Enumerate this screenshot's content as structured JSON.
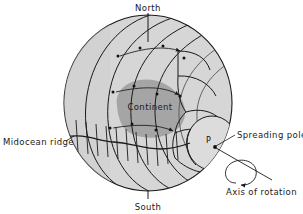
{
  "figure": {
    "title": "",
    "type": "geological-diagram"
  },
  "labels": {
    "north": "North",
    "south": "South",
    "continent": "Continent",
    "midocean_ridge": "Midocean ridge",
    "spreading_pole": "Spreading pole",
    "axis_of_rotation": "Axis of rotation",
    "pole_marker": "P"
  },
  "colors": {
    "background": "#ffffff",
    "sphere_fill": "#d6d6d6",
    "sphere_fill_alt": "#cfcfcf",
    "continent_fill": "#a5a5a5",
    "line": "#1a1a1a",
    "line_soft": "#4a4a4a",
    "text": "#1a1a1a"
  },
  "geometry": {
    "sphere_center_x": 148,
    "sphere_center_y": 103,
    "sphere_radius_x": 84,
    "sphere_radius_y": 88,
    "pole_x": 213,
    "pole_y": 144
  }
}
